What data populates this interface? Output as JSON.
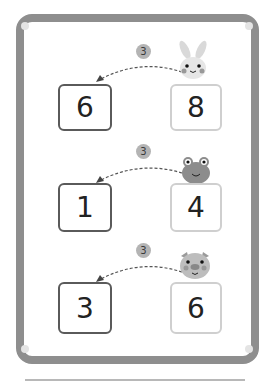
{
  "worksheet": {
    "rows": [
      {
        "animal": "rabbit",
        "given": "8",
        "step": "3",
        "answer": "6"
      },
      {
        "animal": "frog",
        "given": "4",
        "step": "3",
        "answer": "1"
      },
      {
        "animal": "pig",
        "given": "6",
        "step": "3",
        "answer": "3"
      }
    ]
  },
  "colors": {
    "frame": "#8e8e8e",
    "answer_border": "#5a5a5a",
    "given_border": "#cfcfcf",
    "badge": "#b4b4b4"
  }
}
